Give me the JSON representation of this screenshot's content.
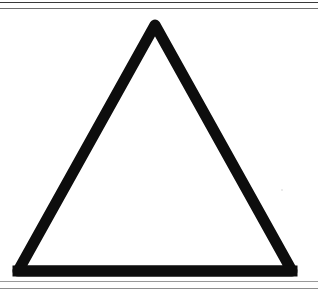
{
  "figure": {
    "caption": "",
    "shape_name": "triangle",
    "description": "Outlined equilateral-style triangle (delta) drawn with a thick black stroke on a white background",
    "background_color": "#ffffff",
    "stroke_color": "#0d0d0d",
    "stroke_width_px": 11,
    "canvas": {
      "width": 318,
      "height": 293
    }
  },
  "rules": {
    "top_1_color": "#3a3a3a",
    "top_2_color": "#6e6e6e",
    "bottom_1_color": "#9a9a9a",
    "bottom_2_color": "#8d8d8d"
  },
  "chart_data": {
    "type": "scatter",
    "title": "",
    "subtitle": "",
    "xlabel": "",
    "ylabel": "",
    "xlim": [
      0,
      318
    ],
    "ylim": [
      0,
      272
    ],
    "grid": false,
    "legend": [],
    "annotations": [],
    "tick_labels": {
      "x": [],
      "y": []
    },
    "series": [
      {
        "name": "triangle-outline",
        "kind": "closed-polyline",
        "stroke": "#0d0d0d",
        "stroke_width": 11,
        "fill": "none",
        "x": [
          155,
          292,
          18,
          155
        ],
        "y": [
          16,
          262,
          262,
          16
        ]
      }
    ],
    "vertices": [
      {
        "label": "apex",
        "x": 155,
        "y": 16
      },
      {
        "label": "bottom-right",
        "x": 292,
        "y": 262
      },
      {
        "label": "bottom-left",
        "x": 18,
        "y": 262
      }
    ]
  }
}
